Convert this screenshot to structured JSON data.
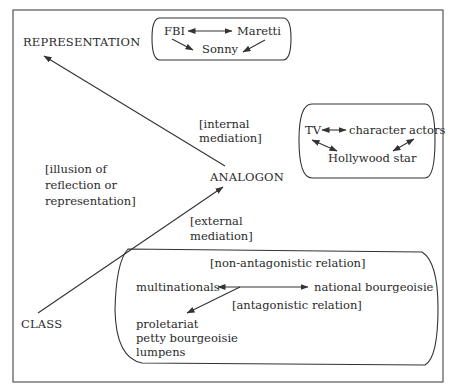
{
  "diagram": {
    "nodes": {
      "representation": "REPRESENTATION",
      "analogon": "ANALOGON",
      "class": "CLASS"
    },
    "annotations": {
      "illusion": [
        "[illusion of",
        "reflection or",
        "representation]"
      ],
      "internal_mediation": [
        "[internal",
        "mediation]"
      ],
      "external_mediation": [
        "[external",
        "mediation]"
      ]
    },
    "representation_box": {
      "items": {
        "fbi": "FBI",
        "maretti": "Maretti",
        "sonny": "Sonny"
      },
      "relations": [
        {
          "from": "FBI",
          "to": "Maretti",
          "type": "bidirectional"
        },
        {
          "from": "FBI",
          "to": "Sonny",
          "type": "directed"
        },
        {
          "from": "Maretti",
          "to": "Sonny",
          "type": "directed"
        }
      ]
    },
    "analogon_box": {
      "items": {
        "tv": "TV",
        "character_actors": "character actors",
        "hollywood_star": "Hollywood star"
      },
      "relations": [
        {
          "from": "TV",
          "to": "character actors",
          "type": "bidirectional"
        },
        {
          "from": "TV",
          "to": "Hollywood star",
          "type": "bidirectional"
        },
        {
          "from": "character actors",
          "to": "Hollywood star",
          "type": "bidirectional"
        }
      ]
    },
    "class_box": {
      "non_antagonistic_label": "[non-antagonistic relation]",
      "antagonistic_label": "[antagonistic relation]",
      "items": {
        "multinationals": "multinationals",
        "national_bourgeoisie": "national bourgeoisie",
        "dominated": [
          "proletariat",
          "petty bourgeoisie",
          "lumpens"
        ]
      },
      "relations": [
        {
          "from": "multinationals",
          "to": "national bourgeoisie",
          "type": "non-antagonistic"
        },
        {
          "from": "multinationals",
          "to": "proletariat / petty bourgeoisie / lumpens",
          "type": "antagonistic"
        }
      ]
    },
    "arrows": [
      {
        "from": "ANALOGON",
        "to": "REPRESENTATION"
      },
      {
        "from": "CLASS",
        "to": "ANALOGON"
      }
    ]
  }
}
